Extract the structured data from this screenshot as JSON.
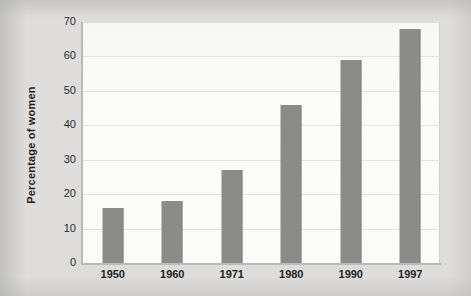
{
  "chart_data": {
    "type": "bar",
    "title": "",
    "subtitle": "",
    "xlabel": "",
    "ylabel": "Percentage of women",
    "categories": [
      "1950",
      "1960",
      "1971",
      "1980",
      "1990",
      "1997"
    ],
    "values": [
      16,
      18,
      27,
      46,
      59,
      68
    ],
    "series": [
      {
        "name": "Percentage of women",
        "values": [
          16,
          18,
          27,
          46,
          59,
          68
        ]
      }
    ],
    "ylim": [
      0,
      70
    ],
    "ytick_labels": [
      "0",
      "10",
      "20",
      "30",
      "40",
      "50",
      "60",
      "70"
    ],
    "ytick_values": [
      0,
      10,
      20,
      30,
      40,
      50,
      60,
      70
    ],
    "grid": true,
    "legend": false,
    "legend_position": "none",
    "colors": {
      "bar": "#8b8b8a",
      "plot_background": "#fbfbfa",
      "page_background": "#dedddb",
      "axis": "#b9b9b7",
      "gridline": "#e1e1df",
      "text": "#1e1e1e"
    }
  }
}
